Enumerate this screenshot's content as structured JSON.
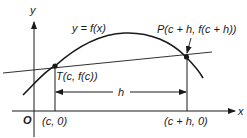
{
  "diagram": {
    "axes": {
      "y_label": "y",
      "x_label": "x",
      "origin_label": "O"
    },
    "curve": {
      "label": "y = f(x)"
    },
    "points": {
      "T": {
        "label": "T(c, f(c))"
      },
      "P": {
        "label": "P(c + h, f(c + h))"
      }
    },
    "x_ticks": {
      "c": "(c, 0)",
      "c_plus_h": "(c + h, 0)"
    },
    "interval": {
      "label": "h"
    },
    "colors": {
      "stroke": "#1a1a1a",
      "background": "#ffffff"
    }
  }
}
